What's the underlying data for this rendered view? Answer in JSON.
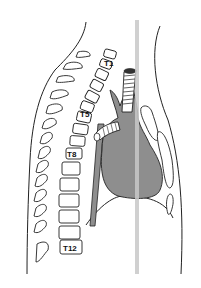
{
  "diagram": {
    "type": "sagittal thoracic anatomy line drawing",
    "vertebra_labels": [
      "T1",
      "T5",
      "T8",
      "T12"
    ],
    "colors": {
      "background": "#ffffff",
      "line": "#222222",
      "organ_fill": "#8e8e8e",
      "reference_line": "#c8c8c8"
    }
  }
}
